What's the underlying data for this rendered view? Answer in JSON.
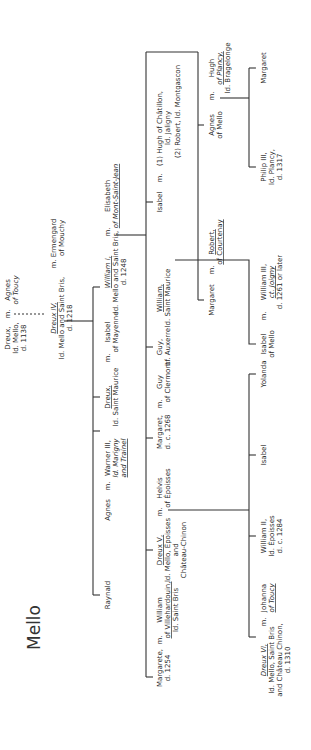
{
  "title": "Mello",
  "people": {
    "dreux": [
      "Dreux,",
      "ld. Mello,",
      "d. 1138"
    ],
    "agnes_toucy_m": "m.",
    "agnes_toucy": [
      "Agnes",
      "of Toucy"
    ],
    "dreux4": [
      "Dreux IV,",
      "ld. Mello and Saint Bris,",
      "d. 1218"
    ],
    "ermengard_m": "m.",
    "ermengard": [
      "Ermengard",
      "of Mouchy"
    ],
    "william1": [
      "William I,",
      "ld. Mello and Saint Bris,",
      "d. 1248"
    ],
    "elisabeth_m": "m.",
    "elisabeth": [
      "Elisabeth",
      "of Mont-Saint-Jean"
    ],
    "isabel_mayenne": [
      "Isabel",
      "of Mayenne"
    ],
    "isabel_mayenne_m": "m.",
    "dreux_sm": [
      "Dreux,",
      "ld. Saint Maurice"
    ],
    "warner": [
      "Warner III,",
      "ld. Marigny",
      "and Trainel"
    ],
    "agnes_sib": "Agnes",
    "agnes_sib_m": "m.",
    "raynald": "Raynald",
    "isabel_chat": "Isabel",
    "isabel_chat_m": "m.",
    "isabel_chat_sp": [
      "(1) Hugh of Châtillon,",
      "ld. Jaligny",
      "(2) Robert, ld. Montgascon"
    ],
    "margaret_top": "Margaret",
    "margaret_top_m": "m.",
    "robert": [
      "Robert,",
      "of Courtenay"
    ],
    "agnes_mello": [
      "Agnes",
      "of Mello"
    ],
    "agnes_mello_m": "m.",
    "hugh_plancy": [
      "Hugh",
      "of Plancy,",
      "ld. Bragelonge"
    ],
    "philip3": [
      "Philip III,",
      "ld. Plancy,",
      "d. 1317"
    ],
    "margaret_plancy": "Margaret",
    "william_sm": [
      "William,",
      "ld. Saint Maurice"
    ],
    "guy": [
      "Guy,",
      "bf. Auxerre"
    ],
    "guy_clermont": [
      "Guy",
      "of Clermont"
    ],
    "guy_clermont_m": "m.",
    "margaret_1268": [
      "Margaret,",
      "d. c. 1268"
    ],
    "isabel_jo": [
      "Isabel",
      "of Mello"
    ],
    "isabel_jo_m": "m.",
    "william3": [
      "William III,",
      "ct. Joigny",
      "d. 1261 or later"
    ],
    "helvis": [
      "Helvis",
      "of Époisses"
    ],
    "helvis_m": "m.",
    "dreux5": [
      "Dreux V,",
      "ld. Mello, Époisses",
      "and",
      "Château-Chinon"
    ],
    "william_vil": [
      "William",
      "of Villehardouin,",
      "ld. Saint Bris"
    ],
    "margarete_m": "m.",
    "margarete": [
      "Margarete,",
      "d. 1254"
    ],
    "yolanda": "Yolanda",
    "isabel_5": "Isabel",
    "william2": [
      "William II,",
      "ld. Époisses",
      "d. c. 1284"
    ],
    "johanna": [
      "Johanna",
      "of Toucy"
    ],
    "johanna_m": "m.",
    "dreux6": [
      "Dreux VI,",
      "ld. Mello, Saint Bris",
      "and Château Chinon,",
      "d. 1310"
    ]
  }
}
